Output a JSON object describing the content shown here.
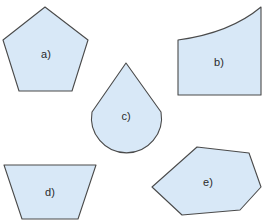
{
  "colors": {
    "fill": "#d8e8f7",
    "stroke": "#4a4a4a",
    "label": "#2a2a2a",
    "background": "#ffffff"
  },
  "shapes": [
    {
      "id": "a",
      "label": "a)",
      "kind": "regular pentagon"
    },
    {
      "id": "b",
      "label": "b)",
      "kind": "quadrilateral with one curved edge"
    },
    {
      "id": "c",
      "label": "c)",
      "kind": "teardrop (circle sector with tangent lines)"
    },
    {
      "id": "d",
      "label": "d)",
      "kind": "isosceles trapezoid"
    },
    {
      "id": "e",
      "label": "e)",
      "kind": "irregular hexagon"
    }
  ]
}
